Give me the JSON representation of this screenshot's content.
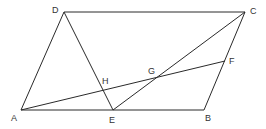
{
  "diagram": {
    "type": "geometry",
    "stroke_color": "#2a2a2a",
    "label_color": "#333333",
    "points": {
      "A": {
        "x": 21,
        "y": 110,
        "label": "A",
        "lx": 11,
        "ly": 121
      },
      "B": {
        "x": 204,
        "y": 110,
        "label": "B",
        "lx": 205,
        "ly": 121
      },
      "C": {
        "x": 245,
        "y": 12,
        "label": "C",
        "lx": 250,
        "ly": 14
      },
      "D": {
        "x": 64,
        "y": 12,
        "label": "D",
        "lx": 52,
        "ly": 13
      },
      "E": {
        "x": 113,
        "y": 110,
        "label": "E",
        "lx": 109,
        "ly": 123
      },
      "F": {
        "x": 225,
        "y": 61,
        "label": "F",
        "lx": 229,
        "ly": 64
      },
      "G": {
        "x": 156,
        "y": 78,
        "label": "G",
        "lx": 148,
        "ly": 74
      },
      "H": {
        "x": 103,
        "y": 90,
        "label": "H",
        "lx": 102,
        "ly": 84
      }
    },
    "segments": [
      [
        "A",
        "B"
      ],
      [
        "B",
        "C"
      ],
      [
        "C",
        "D"
      ],
      [
        "D",
        "A"
      ],
      [
        "D",
        "E"
      ],
      [
        "E",
        "C"
      ],
      [
        "A",
        "F"
      ]
    ]
  }
}
